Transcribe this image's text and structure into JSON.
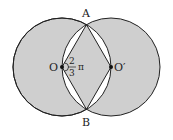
{
  "diagram": {
    "points": {
      "A": "A",
      "B": "B",
      "O": "O",
      "O_prime": "O′"
    },
    "angle_label": {
      "numerator": "2",
      "denominator": "3",
      "symbol": "π"
    },
    "colors": {
      "fill": "#cfcfcf",
      "stroke": "#222222",
      "lens_gaps": "#ffffff"
    }
  }
}
